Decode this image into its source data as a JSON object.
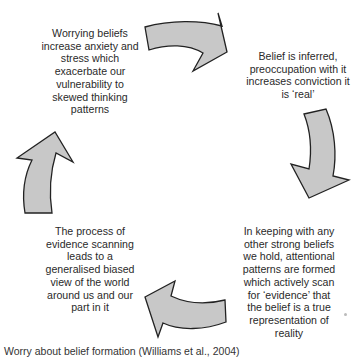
{
  "diagram": {
    "type": "cycle",
    "nodes": [
      {
        "id": "top-left",
        "text": "Worrying beliefs increase anxiety and stress which exacerbate our vulnerability to skewed thinking patterns"
      },
      {
        "id": "top-right",
        "text": "Belief is inferred, preoccupation with it increases conviction it is ‘real’"
      },
      {
        "id": "bottom-right",
        "text": "In keeping with any other strong beliefs we hold, attentional patterns are formed which actively scan for ‘evidence’ that the belief is a true representation of reality"
      },
      {
        "id": "bottom-left",
        "text": "The process of evidence scanning leads to a generalised biased view of the world around us and our part in it"
      }
    ],
    "arrows": [
      {
        "from": "top-left",
        "to": "top-right",
        "icon": "curved-arrow-right-icon"
      },
      {
        "from": "top-right",
        "to": "bottom-right",
        "icon": "curved-arrow-down-icon"
      },
      {
        "from": "bottom-right",
        "to": "bottom-left",
        "icon": "curved-arrow-left-icon"
      },
      {
        "from": "bottom-left",
        "to": "top-left",
        "icon": "curved-arrow-up-icon"
      }
    ],
    "arrow_fill": "#c8c8c8",
    "arrow_stroke": "#222222"
  },
  "caption": "Worry about belief formation (Williams et al., 2004)"
}
